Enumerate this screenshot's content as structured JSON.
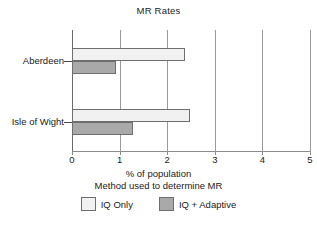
{
  "chart_data": {
    "type": "bar",
    "orientation": "horizontal",
    "title": "MR Rates",
    "categories": [
      "Aberdeen",
      "Isle of Wight"
    ],
    "series": [
      {
        "name": "IQ Only",
        "color": "#f1f1f1",
        "values": [
          2.38,
          2.48
        ]
      },
      {
        "name": "IQ + Adaptive",
        "color": "#a9a9a9",
        "values": [
          0.92,
          1.28
        ]
      }
    ],
    "xlabel": "% of population",
    "xlabel_secondary": "Method used to determine MR",
    "ylabel": "",
    "xlim": [
      0,
      5
    ],
    "xticks": [
      0,
      1,
      2,
      3,
      4,
      5
    ],
    "xtick_labels": [
      "0",
      "1",
      "2",
      "3",
      "4",
      "5"
    ],
    "grid": "vertical",
    "legend_position": "bottom"
  },
  "legend": {
    "entries": [
      {
        "label": "IQ Only"
      },
      {
        "label": "IQ + Adaptive"
      }
    ]
  }
}
